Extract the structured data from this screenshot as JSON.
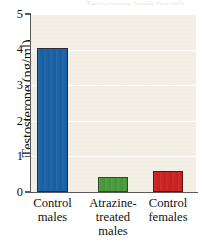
{
  "figure": {
    "caption_sliver": "Testosterone levels (ng/ml)"
  },
  "chart_data": {
    "type": "bar",
    "title": "",
    "xlabel": "",
    "ylabel": "Testosterone (ng/ml)",
    "ylim": [
      0,
      5
    ],
    "ytick_labels": [
      "0",
      "1",
      "2",
      "3",
      "4",
      "5"
    ],
    "yticks": [
      0,
      1,
      2,
      3,
      4,
      5
    ],
    "grid": true,
    "grid_axis": "y",
    "legend": false,
    "categories": [
      "Control males",
      "Atrazine-treated males",
      "Control females"
    ],
    "category_lines": [
      [
        "Control",
        "males"
      ],
      [
        "Atrazine-",
        "treated",
        "males"
      ],
      [
        "Control",
        "females"
      ]
    ],
    "values": [
      4.05,
      0.42,
      0.6
    ],
    "bar_colors": [
      "#1a62a5",
      "#4a9a3c",
      "#cc2222"
    ],
    "bar_edge_colors": [
      "#2a2a38",
      "#2d4d24",
      "#5c1410"
    ],
    "plot_background": "#f3ede2",
    "page_background": "#ffffff",
    "axis_color": "#5a5a5a",
    "gridline_color": "#ffffff"
  }
}
